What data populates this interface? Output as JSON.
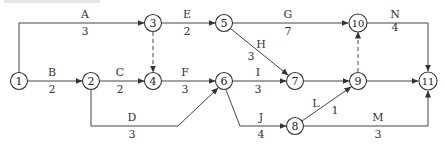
{
  "diagram": {
    "type": "activity-on-arrow network",
    "nodes": [
      {
        "id": "1",
        "label": "1",
        "x": 19,
        "y": 81
      },
      {
        "id": "2",
        "label": "2",
        "x": 91,
        "y": 81
      },
      {
        "id": "3",
        "label": "3",
        "x": 153,
        "y": 23
      },
      {
        "id": "4",
        "label": "4",
        "x": 153,
        "y": 81
      },
      {
        "id": "5",
        "label": "5",
        "x": 224,
        "y": 23
      },
      {
        "id": "6",
        "label": "6",
        "x": 224,
        "y": 81
      },
      {
        "id": "7",
        "label": "7",
        "x": 295,
        "y": 81
      },
      {
        "id": "8",
        "label": "8",
        "x": 295,
        "y": 126
      },
      {
        "id": "9",
        "label": "9",
        "x": 358,
        "y": 81
      },
      {
        "id": "10",
        "label": "10",
        "x": 358,
        "y": 23
      },
      {
        "id": "11",
        "label": "11",
        "x": 428,
        "y": 81
      }
    ],
    "activities": [
      {
        "name": "A",
        "duration": "3",
        "from": "1",
        "to": "3"
      },
      {
        "name": "B",
        "duration": "2",
        "from": "1",
        "to": "2"
      },
      {
        "name": "C",
        "duration": "2",
        "from": "2",
        "to": "4"
      },
      {
        "name": "D",
        "duration": "3",
        "from": "2",
        "to": "6"
      },
      {
        "name": "E",
        "duration": "2",
        "from": "3",
        "to": "5"
      },
      {
        "name": "F",
        "duration": "3",
        "from": "4",
        "to": "6"
      },
      {
        "name": "G",
        "duration": "7",
        "from": "5",
        "to": "10"
      },
      {
        "name": "H",
        "duration": "3",
        "from": "5",
        "to": "7"
      },
      {
        "name": "I",
        "duration": "3",
        "from": "6",
        "to": "7"
      },
      {
        "name": "J",
        "duration": "4",
        "from": "6",
        "to": "8"
      },
      {
        "name": "L",
        "duration": "1",
        "from": "8",
        "to": "9"
      },
      {
        "name": "M",
        "duration": "3",
        "from": "8",
        "to": "11"
      },
      {
        "name": "N",
        "duration": "4",
        "from": "10",
        "to": "11"
      }
    ],
    "dummy_activities": [
      {
        "from": "3",
        "to": "4"
      },
      {
        "from": "9",
        "to": "10"
      }
    ],
    "unlabeled_arrows": [
      {
        "from": "7",
        "to": "9"
      },
      {
        "from": "9",
        "to": "11"
      }
    ]
  },
  "labels": {
    "A": {
      "name": "A",
      "dur": "3"
    },
    "B": {
      "name": "B",
      "dur": "2"
    },
    "C": {
      "name": "C",
      "dur": "2"
    },
    "D": {
      "name": "D",
      "dur": "3"
    },
    "E": {
      "name": "E",
      "dur": "2"
    },
    "F": {
      "name": "F",
      "dur": "3"
    },
    "G": {
      "name": "G",
      "dur": "7"
    },
    "H": {
      "name": "H",
      "dur": "3"
    },
    "I": {
      "name": "I",
      "dur": "3"
    },
    "J": {
      "name": "J",
      "dur": "4"
    },
    "L": {
      "name": "L",
      "dur": "1"
    },
    "M": {
      "name": "M",
      "dur": "3"
    },
    "N": {
      "name": "N",
      "dur": "4"
    }
  },
  "node_labels": {
    "n1": "1",
    "n2": "2",
    "n3": "3",
    "n4": "4",
    "n5": "5",
    "n6": "6",
    "n7": "7",
    "n8": "8",
    "n9": "9",
    "n10": "10",
    "n11": "11"
  }
}
